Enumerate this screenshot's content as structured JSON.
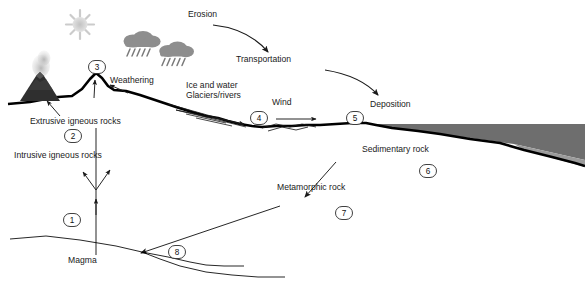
{
  "diagram": {
    "type": "geology-process-diagram"
  },
  "labels": {
    "erosion": "Erosion",
    "transportation": "Transportation",
    "weathering": "Weathering",
    "ice_and_water": "Ice and water",
    "glaciers_rivers": "Glaciers/rivers",
    "wind": "Wind",
    "deposition": "Deposition",
    "extrusive": "Extrusive igneous rocks",
    "intrusive": "Intrusive igneous rocks",
    "sedimentary": "Sedimentary rock",
    "metamorphic": "Metamorphic rock",
    "magma": "Magma"
  },
  "badges": [
    {
      "id": "badge-1",
      "number": "1",
      "x": 72,
      "y": 220
    },
    {
      "id": "badge-2",
      "number": "2",
      "x": 73,
      "y": 136
    },
    {
      "id": "badge-3",
      "number": "3",
      "x": 97,
      "y": 67
    },
    {
      "id": "badge-4",
      "number": "4",
      "x": 259,
      "y": 118
    },
    {
      "id": "badge-5",
      "number": "5",
      "x": 355,
      "y": 118
    },
    {
      "id": "badge-6",
      "number": "6",
      "x": 428,
      "y": 171
    },
    {
      "id": "badge-7",
      "number": "7",
      "x": 344,
      "y": 213
    },
    {
      "id": "badge-8",
      "number": "8",
      "x": 177,
      "y": 252
    }
  ],
  "icons": {
    "sun": "sun-icon",
    "cloud_left": "rain-cloud-icon",
    "cloud_right": "rain-cloud-icon",
    "volcano": "volcano-icon"
  },
  "colors": {
    "ink": "#1a1a1a",
    "sediment_dark": "#6e6e6e",
    "sediment_light": "#9a9a9a",
    "cloud_gray": "#8c8c8c",
    "sun_gray": "#c9c9c9",
    "volcano_dark": "#2b2b2b",
    "smoke_gray": "#bdbdbd",
    "background": "#ffffff"
  }
}
